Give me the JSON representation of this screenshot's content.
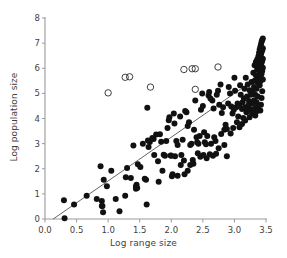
{
  "chart_data": {
    "type": "scatter",
    "title": "",
    "xlabel": "Log range size",
    "ylabel": "Log population size",
    "xlim": [
      0.0,
      3.5
    ],
    "ylim": [
      0,
      8
    ],
    "xticks": [
      "0.0",
      "0.5",
      "1.0",
      "1.5",
      "2.0",
      "2.5",
      "3.0",
      "3.5"
    ],
    "xtick_values": [
      0.0,
      0.5,
      1.0,
      1.5,
      2.0,
      2.5,
      3.0,
      3.5
    ],
    "yticks": [
      "0",
      "1",
      "2",
      "3",
      "4",
      "5",
      "6",
      "7",
      "8"
    ],
    "ytick_values": [
      0,
      1,
      2,
      3,
      4,
      5,
      6,
      7,
      8
    ],
    "grid": false,
    "legend": "none",
    "marker_color": "#111111",
    "line_color": "#555555",
    "axis_color": "#9a9a9a",
    "background": "#ffffff",
    "series": [
      {
        "name": "filled",
        "marker": "filled-circle",
        "marker_size": 3.0,
        "points": [
          [
            0.3,
            0.75
          ],
          [
            0.31,
            0.03
          ],
          [
            0.46,
            0.58
          ],
          [
            0.66,
            0.93
          ],
          [
            0.82,
            0.8
          ],
          [
            0.9,
            0.72
          ],
          [
            0.9,
            0.52
          ],
          [
            0.91,
            0.52
          ],
          [
            0.92,
            0.27
          ],
          [
            0.88,
            2.1
          ],
          [
            0.93,
            1.56
          ],
          [
            0.98,
            1.3
          ],
          [
            1.05,
            1.92
          ],
          [
            1.12,
            0.8
          ],
          [
            1.18,
            0.31
          ],
          [
            1.27,
            0.93
          ],
          [
            1.28,
            1.66
          ],
          [
            1.3,
            2.03
          ],
          [
            1.36,
            1.63
          ],
          [
            1.4,
            2.93
          ],
          [
            1.44,
            1.29
          ],
          [
            1.44,
            1.2
          ],
          [
            1.45,
            1.36
          ],
          [
            1.46,
            1.23
          ],
          [
            1.47,
            2.18
          ],
          [
            1.51,
            2.07
          ],
          [
            1.55,
            3.0
          ],
          [
            1.58,
            1.6
          ],
          [
            1.6,
            1.56
          ],
          [
            1.61,
            0.58
          ],
          [
            1.62,
            4.43
          ],
          [
            1.63,
            3.12
          ],
          [
            1.64,
            2.87
          ],
          [
            1.66,
            3.06
          ],
          [
            1.7,
            3.22
          ],
          [
            1.72,
            3.18
          ],
          [
            1.73,
            2.55
          ],
          [
            1.76,
            3.36
          ],
          [
            1.79,
            2.3
          ],
          [
            1.8,
            1.48
          ],
          [
            1.82,
            3.37
          ],
          [
            1.84,
            3.07
          ],
          [
            1.86,
            1.92
          ],
          [
            1.88,
            2.56
          ],
          [
            1.9,
            2.52
          ],
          [
            1.92,
            3.1
          ],
          [
            1.94,
            3.62
          ],
          [
            1.96,
            3.93
          ],
          [
            1.97,
            4.05
          ],
          [
            1.99,
            2.53
          ],
          [
            2.0,
            2.52
          ],
          [
            2.01,
            1.7
          ],
          [
            2.02,
            1.78
          ],
          [
            2.04,
            4.2
          ],
          [
            2.05,
            3.8
          ],
          [
            2.06,
            2.5
          ],
          [
            2.08,
            3.1
          ],
          [
            2.1,
            2.95
          ],
          [
            2.14,
            4.08
          ],
          [
            2.16,
            2.55
          ],
          [
            2.18,
            3.15
          ],
          [
            2.2,
            2.33
          ],
          [
            2.22,
            4.3
          ],
          [
            2.24,
            4.25
          ],
          [
            2.26,
            3.7
          ],
          [
            2.28,
            3.85
          ],
          [
            2.3,
            2.95
          ],
          [
            2.32,
            3.0
          ],
          [
            2.34,
            2.35
          ],
          [
            2.36,
            3.55
          ],
          [
            2.38,
            4.72
          ],
          [
            2.4,
            3.25
          ],
          [
            2.41,
            3.05
          ],
          [
            2.43,
            3.0
          ],
          [
            2.45,
            3.3
          ],
          [
            2.47,
            4.35
          ],
          [
            2.49,
            5.0
          ],
          [
            2.5,
            4.5
          ],
          [
            2.52,
            3.45
          ],
          [
            2.53,
            3.05
          ],
          [
            2.55,
            2.98
          ],
          [
            2.57,
            3.3
          ],
          [
            2.59,
            4.92
          ],
          [
            2.6,
            5.05
          ],
          [
            2.62,
            4.8
          ],
          [
            2.63,
            3.0
          ],
          [
            2.65,
            4.72
          ],
          [
            2.67,
            4.4
          ],
          [
            2.68,
            3.25
          ],
          [
            2.7,
            3.1
          ],
          [
            2.72,
            4.95
          ],
          [
            2.74,
            5.1
          ],
          [
            2.76,
            4.55
          ],
          [
            2.78,
            5.35
          ],
          [
            2.8,
            4.22
          ],
          [
            2.82,
            4.45
          ],
          [
            2.84,
            3.55
          ],
          [
            2.86,
            3.75
          ],
          [
            2.88,
            2.5
          ],
          [
            2.9,
            4.6
          ],
          [
            2.91,
            5.25
          ],
          [
            2.93,
            5.0
          ],
          [
            2.95,
            4.48
          ],
          [
            2.97,
            4.2
          ],
          [
            2.99,
            4.35
          ],
          [
            3.0,
            5.62
          ],
          [
            3.01,
            5.1
          ],
          [
            3.03,
            4.45
          ],
          [
            3.05,
            4.6
          ],
          [
            3.06,
            4.08
          ],
          [
            3.08,
            4.52
          ],
          [
            3.09,
            5.32
          ],
          [
            3.1,
            4.95
          ],
          [
            3.12,
            4.38
          ],
          [
            3.13,
            4.65
          ],
          [
            3.14,
            4.02
          ],
          [
            3.15,
            4.8
          ],
          [
            3.16,
            5.18
          ],
          [
            3.17,
            4.45
          ],
          [
            3.18,
            5.62
          ],
          [
            3.19,
            4.25
          ],
          [
            3.2,
            4.88
          ],
          [
            3.21,
            5.35
          ],
          [
            3.22,
            4.52
          ],
          [
            3.23,
            4.7
          ],
          [
            3.24,
            5.12
          ],
          [
            3.25,
            4.38
          ],
          [
            3.26,
            4.95
          ],
          [
            3.27,
            5.45
          ],
          [
            3.28,
            4.6
          ],
          [
            3.29,
            5.05
          ],
          [
            3.3,
            5.82
          ],
          [
            3.3,
            4.28
          ],
          [
            3.31,
            5.25
          ],
          [
            3.31,
            4.72
          ],
          [
            3.32,
            6.12
          ],
          [
            3.32,
            5.5
          ],
          [
            3.33,
            4.95
          ],
          [
            3.33,
            4.42
          ],
          [
            3.34,
            6.25
          ],
          [
            3.34,
            5.72
          ],
          [
            3.35,
            5.18
          ],
          [
            3.35,
            4.65
          ],
          [
            3.36,
            6.35
          ],
          [
            3.36,
            5.95
          ],
          [
            3.37,
            5.42
          ],
          [
            3.37,
            4.88
          ],
          [
            3.38,
            6.48
          ],
          [
            3.38,
            6.05
          ],
          [
            3.38,
            5.6
          ],
          [
            3.39,
            6.62
          ],
          [
            3.39,
            6.18
          ],
          [
            3.39,
            5.72
          ],
          [
            3.4,
            6.75
          ],
          [
            3.4,
            6.3
          ],
          [
            3.4,
            5.88
          ],
          [
            3.4,
            5.32
          ],
          [
            3.41,
            6.85
          ],
          [
            3.41,
            6.42
          ],
          [
            3.41,
            6.0
          ],
          [
            3.41,
            5.48
          ],
          [
            3.42,
            6.95
          ],
          [
            3.42,
            6.55
          ],
          [
            3.42,
            6.12
          ],
          [
            3.42,
            5.62
          ],
          [
            3.43,
            7.05
          ],
          [
            3.43,
            6.65
          ],
          [
            3.43,
            6.22
          ],
          [
            3.43,
            5.78
          ],
          [
            3.44,
            7.12
          ],
          [
            3.44,
            6.72
          ],
          [
            3.44,
            6.3
          ],
          [
            3.44,
            5.9
          ],
          [
            3.45,
            7.18
          ],
          [
            3.45,
            6.8
          ],
          [
            3.45,
            6.38
          ],
          [
            3.45,
            6.02
          ],
          [
            3.45,
            5.55
          ],
          [
            3.44,
            5.08
          ],
          [
            3.43,
            4.82
          ],
          [
            3.42,
            4.55
          ],
          [
            3.41,
            4.32
          ],
          [
            3.38,
            4.52
          ],
          [
            3.36,
            4.3
          ],
          [
            3.33,
            4.12
          ],
          [
            3.3,
            4.65
          ],
          [
            3.28,
            4.2
          ],
          [
            3.24,
            4.05
          ],
          [
            3.2,
            4.32
          ],
          [
            3.17,
            3.92
          ],
          [
            3.12,
            3.78
          ],
          [
            3.08,
            3.65
          ],
          [
            3.04,
            3.85
          ],
          [
            2.98,
            3.62
          ],
          [
            2.94,
            3.4
          ],
          [
            2.88,
            3.58
          ],
          [
            2.84,
            2.95
          ],
          [
            2.79,
            3.38
          ],
          [
            2.75,
            2.82
          ],
          [
            2.71,
            2.6
          ],
          [
            2.66,
            2.52
          ],
          [
            2.61,
            2.58
          ],
          [
            2.56,
            2.42
          ],
          [
            2.51,
            2.55
          ],
          [
            2.46,
            2.48
          ],
          [
            2.42,
            2.62
          ],
          [
            2.35,
            2.2
          ],
          [
            2.3,
            2.15
          ],
          [
            2.26,
            1.92
          ],
          [
            2.21,
            1.78
          ],
          [
            2.15,
            2.15
          ],
          [
            2.1,
            1.72
          ]
        ]
      },
      {
        "name": "open",
        "marker": "open-circle",
        "marker_size": 3.2,
        "points": [
          [
            1.0,
            5.02
          ],
          [
            1.27,
            5.64
          ],
          [
            1.34,
            5.66
          ],
          [
            1.67,
            5.25
          ],
          [
            2.2,
            5.95
          ],
          [
            2.33,
            5.98
          ],
          [
            2.38,
            5.98
          ],
          [
            2.38,
            5.16
          ],
          [
            2.74,
            6.05
          ]
        ]
      }
    ],
    "trendline": {
      "name": "regression-line",
      "x_start": 0.13,
      "y_start": 0.0,
      "x_end": 3.46,
      "y_end": 5.8
    }
  }
}
